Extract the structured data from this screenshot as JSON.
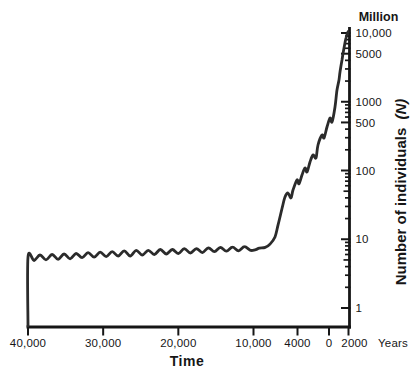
{
  "chart_data": {
    "type": "line",
    "x_axis": {
      "title": "Time",
      "suffix_label": "Years",
      "ticks": [
        {
          "year": 40000,
          "label": "40,000"
        },
        {
          "year": 30000,
          "label": "30,000"
        },
        {
          "year": 20000,
          "label": "20,000"
        },
        {
          "year": 10000,
          "label": "10,000"
        },
        {
          "year": 4000,
          "label": "4000"
        },
        {
          "year": 0,
          "label": "0"
        },
        {
          "year": -2000,
          "label": "2000"
        }
      ]
    },
    "y_axis": {
      "unit_label": "Million",
      "title": "Number of individuals",
      "title_suffix": "(N)",
      "scale": "log",
      "range": [
        1,
        10000
      ],
      "major_ticks": [
        {
          "value": 10000,
          "label": "10,000"
        },
        {
          "value": 5000,
          "label": "5000"
        },
        {
          "value": 1000,
          "label": "1000"
        },
        {
          "value": 500,
          "label": "500"
        },
        {
          "value": 100,
          "label": "100"
        },
        {
          "value": 10,
          "label": "10"
        },
        {
          "value": 1,
          "label": "1"
        }
      ]
    },
    "series": [
      {
        "name": "population",
        "units": "millions of individuals vs years before present",
        "points": [
          [
            40000,
            0.55
          ],
          [
            40000,
            5.5
          ],
          [
            39200,
            4.9
          ],
          [
            38400,
            5.9
          ],
          [
            37600,
            5.0
          ],
          [
            36800,
            6.0
          ],
          [
            36000,
            5.1
          ],
          [
            35200,
            6.1
          ],
          [
            34400,
            5.2
          ],
          [
            33600,
            6.2
          ],
          [
            32800,
            5.4
          ],
          [
            32000,
            6.4
          ],
          [
            31200,
            5.5
          ],
          [
            30400,
            6.5
          ],
          [
            29600,
            5.6
          ],
          [
            28800,
            6.6
          ],
          [
            28000,
            5.7
          ],
          [
            27200,
            6.8
          ],
          [
            26400,
            5.7
          ],
          [
            25600,
            6.9
          ],
          [
            24800,
            5.9
          ],
          [
            24000,
            6.9
          ],
          [
            23200,
            6.0
          ],
          [
            22400,
            7.1
          ],
          [
            21600,
            6.1
          ],
          [
            20800,
            7.1
          ],
          [
            20000,
            6.2
          ],
          [
            19200,
            7.3
          ],
          [
            18400,
            6.3
          ],
          [
            17600,
            7.3
          ],
          [
            16800,
            6.4
          ],
          [
            16000,
            7.5
          ],
          [
            15200,
            6.6
          ],
          [
            14400,
            7.6
          ],
          [
            13600,
            6.7
          ],
          [
            12800,
            7.7
          ],
          [
            12000,
            6.8
          ],
          [
            11200,
            7.8
          ],
          [
            10400,
            6.9
          ],
          [
            9800,
            7.0
          ],
          [
            9200,
            7.4
          ],
          [
            8400,
            7.6
          ],
          [
            7750,
            8.5
          ],
          [
            7070,
            10.8
          ],
          [
            6660,
            16
          ],
          [
            6110,
            28
          ],
          [
            5700,
            41
          ],
          [
            5290,
            47
          ],
          [
            4890,
            40
          ],
          [
            4610,
            52
          ],
          [
            4070,
            73
          ],
          [
            3810,
            64
          ],
          [
            3430,
            86
          ],
          [
            3050,
            109
          ],
          [
            2790,
            95
          ],
          [
            2410,
            133
          ],
          [
            2030,
            168
          ],
          [
            1650,
            152
          ],
          [
            1400,
            235
          ],
          [
            890,
            328
          ],
          [
            635,
            297
          ],
          [
            254,
            429
          ],
          [
            -105,
            581
          ],
          [
            -308,
            507
          ],
          [
            -615,
            839
          ],
          [
            -820,
            1480
          ],
          [
            -1030,
            2070
          ],
          [
            -1130,
            2710
          ],
          [
            -1330,
            4050
          ],
          [
            -1540,
            6050
          ],
          [
            -1740,
            8450
          ],
          [
            -1950,
            10400
          ]
        ]
      }
    ],
    "colors": {
      "line": "#2b2b2b",
      "axis": "#161616",
      "text": "#161616",
      "background": "#ffffff"
    }
  }
}
